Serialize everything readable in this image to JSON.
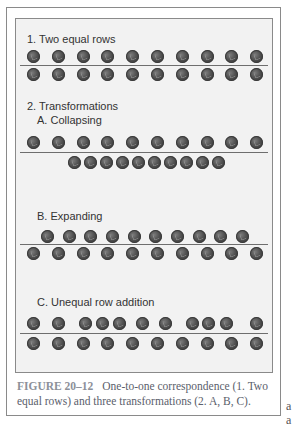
{
  "figure": {
    "sections": [
      {
        "id": "equal",
        "title": "1. Two equal rows",
        "title_y": 33,
        "top_row": {
          "y": 56,
          "x": [
            33,
            58,
            83,
            107,
            132,
            157,
            182,
            207,
            231,
            256
          ]
        },
        "rule_y": 65,
        "bottom_row": {
          "y": 74,
          "x": [
            33,
            58,
            83,
            107,
            132,
            157,
            182,
            207,
            231,
            256
          ]
        }
      },
      {
        "id": "collapsing",
        "heading": "2. Transformations",
        "heading_y": 100,
        "title": "A. Collapsing",
        "title_y": 114,
        "top_row": {
          "y": 142,
          "x": [
            33,
            58,
            83,
            107,
            132,
            157,
            182,
            207,
            231,
            256
          ]
        },
        "rule_y": 152,
        "bottom_row": {
          "y": 162,
          "x": [
            74,
            90,
            106,
            122,
            138,
            154,
            170,
            186,
            202,
            218
          ]
        }
      },
      {
        "id": "expanding",
        "title": "B. Expanding",
        "title_y": 210,
        "top_row": {
          "y": 236,
          "x": [
            47,
            69,
            90,
            112,
            134,
            155,
            177,
            199,
            220,
            242
          ]
        },
        "rule_y": 244,
        "bottom_row": {
          "y": 253,
          "x": [
            33,
            58,
            83,
            107,
            132,
            157,
            182,
            207,
            231,
            256
          ]
        }
      },
      {
        "id": "unequal",
        "title": "C. Unequal row addition",
        "title_y": 296,
        "top_row": {
          "y": 323,
          "x": [
            33,
            58,
            85,
            102,
            119,
            142,
            165,
            192,
            208,
            226,
            256
          ]
        },
        "rule_y": 333,
        "bottom_row": {
          "y": 343,
          "x": [
            33,
            58,
            83,
            107,
            132,
            157,
            182,
            207,
            231,
            256
          ]
        }
      }
    ],
    "coin_icon": "coin-icon",
    "colors": {
      "panel_bg": "#f2f2f2",
      "border": "#8a8a8a",
      "coin": "#4a4a4a",
      "caption": "#5a606b",
      "caption_label": "#8c9099"
    }
  },
  "caption": {
    "label": "FIGURE 20–12",
    "text": "One-to-one correspondence (1. Two equal rows) and three transformations (2. A, B, C)."
  },
  "stray_marks": [
    "a",
    "a"
  ]
}
